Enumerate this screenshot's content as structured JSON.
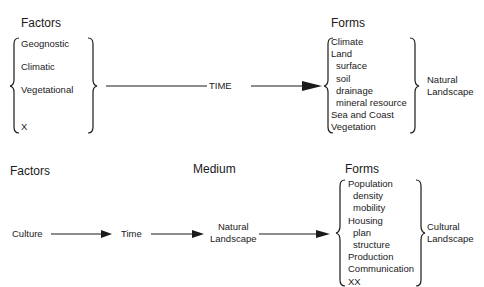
{
  "top": {
    "factors_heading": "Factors",
    "factors": [
      "Geognostic",
      "Climatic",
      "Vegetational",
      "X"
    ],
    "arrow_label": "TIME",
    "forms_heading": "Forms",
    "forms": [
      {
        "label": "Climate",
        "indent": false
      },
      {
        "label": "Land",
        "indent": false
      },
      {
        "label": "surface",
        "indent": true
      },
      {
        "label": "soil",
        "indent": true
      },
      {
        "label": "drainage",
        "indent": true
      },
      {
        "label": "mineral resource",
        "indent": true
      },
      {
        "label": "Sea and Coast",
        "indent": false
      },
      {
        "label": "Vegetation",
        "indent": false
      }
    ],
    "result_line1": "Natural",
    "result_line2": "Landscape"
  },
  "bottom": {
    "factors_heading": "Factors",
    "medium_heading": "Medium",
    "forms_heading": "Forms",
    "chain": [
      "Culture",
      "Time"
    ],
    "medium_line1": "Natural",
    "medium_line2": "Landscape",
    "forms": [
      {
        "label": "Population",
        "indent": false
      },
      {
        "label": "density",
        "indent": true
      },
      {
        "label": "mobility",
        "indent": true
      },
      {
        "label": "Housing",
        "indent": false
      },
      {
        "label": "plan",
        "indent": true
      },
      {
        "label": "structure",
        "indent": true
      },
      {
        "label": "Production",
        "indent": false
      },
      {
        "label": "Communication",
        "indent": false
      },
      {
        "label": "XX",
        "indent": false
      }
    ],
    "result_line1": "Cultural",
    "result_line2": "Landscape"
  },
  "colors": {
    "ink": "#1a1a1a",
    "background": "#ffffff"
  }
}
